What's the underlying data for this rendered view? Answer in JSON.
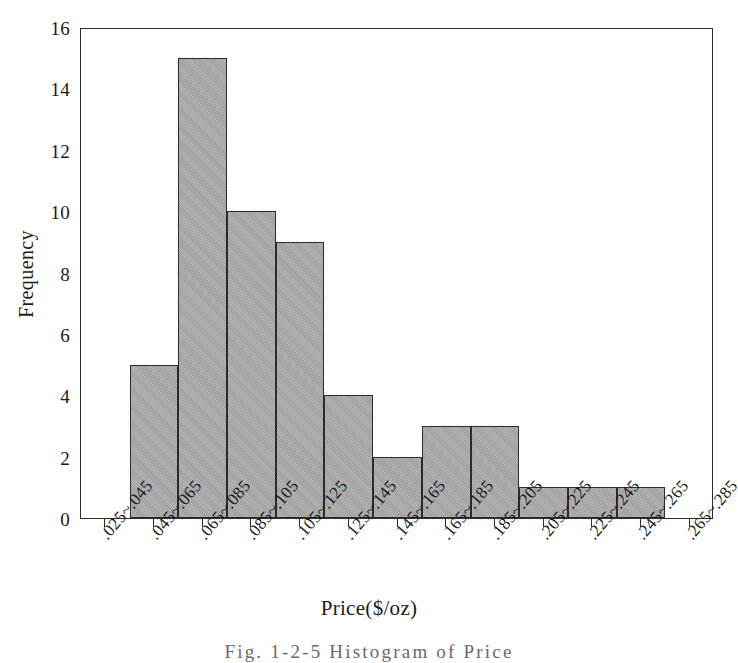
{
  "figure": {
    "caption": "Fig. 1-2-5   Histogram of   Price"
  },
  "axes": {
    "ylabel": "Frequency",
    "xlabel": "Price($/oz)",
    "yticks": [
      "0",
      "2",
      "4",
      "6",
      "8",
      "10",
      "12",
      "14",
      "16"
    ],
    "ytick_values": [
      0,
      2,
      4,
      6,
      8,
      10,
      12,
      14,
      16
    ]
  },
  "style": {
    "bar_fill": "#a9a9a9",
    "bar_stroke": "#2b2b2b",
    "frame_stroke": "#2b2b2b",
    "background": "#ffffff",
    "text_color": "#1a1a1a"
  },
  "chart_data": {
    "type": "bar",
    "title": "",
    "subtitle": "",
    "xlabel": "Price($/oz)",
    "ylabel": "Frequency",
    "categories": [
      ".025~.045",
      ".045~.065",
      ".065~.085",
      ".085~.105",
      ".105~.125",
      ".125~.145",
      ".145~.165",
      ".165~.185",
      ".185~.205",
      ".205~.225",
      ".225~.245",
      ".245~.265",
      ".265~.285"
    ],
    "values": [
      0,
      5,
      15,
      10,
      9,
      4,
      2,
      3,
      3,
      1,
      1,
      1,
      0
    ],
    "ylim": [
      0,
      16
    ],
    "ytick_step": 2,
    "grid": false,
    "legend": false,
    "legend_position": "none",
    "bar_gap": 0,
    "orientation": "vertical"
  }
}
